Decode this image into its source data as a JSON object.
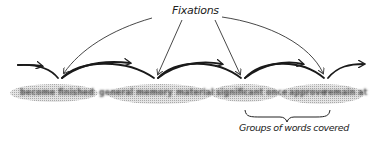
{
  "diagram": {
    "title_label": "Fixations",
    "group_label": "Groups of words covered",
    "fixation_count": 4,
    "colors": {
      "ink": "#222222",
      "group_shading": "#c8c8c8",
      "word_blur": "#505050"
    },
    "fixations": [
      {
        "x": 60,
        "y": 80
      },
      {
        "x": 156,
        "y": 80
      },
      {
        "x": 243,
        "y": 80
      },
      {
        "x": 326,
        "y": 80
      }
    ],
    "word_groups": [
      {
        "x1": 12,
        "x2": 96
      },
      {
        "x1": 112,
        "x2": 212
      },
      {
        "x1": 214,
        "x2": 278
      },
      {
        "x1": 282,
        "x2": 362
      }
    ],
    "words": [
      {
        "text": "become",
        "x": 20
      },
      {
        "text": "finished",
        "x": 58
      },
      {
        "text": "general",
        "x": 99
      },
      {
        "text": "memory",
        "x": 136
      },
      {
        "text": "material",
        "x": 176
      },
      {
        "text": "significant",
        "x": 215
      },
      {
        "text": "once",
        "x": 265
      },
      {
        "text": "approve",
        "x": 288
      },
      {
        "text": "remain",
        "x": 322
      },
      {
        "text": "at",
        "x": 355
      }
    ]
  }
}
